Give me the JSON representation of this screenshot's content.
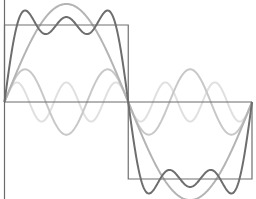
{
  "chart_data": {
    "type": "line",
    "title": "",
    "xlabel": "",
    "ylabel": "",
    "grid": false,
    "legend": null,
    "x_range": [
      0,
      6.2832
    ],
    "y_range": [
      -1.6,
      1.6
    ],
    "square_wave": {
      "high": 1,
      "low": -1,
      "jump_x": 3.1416
    },
    "series": [
      {
        "name": "fundamental (n=1)",
        "harmonic": 1,
        "amplitude": 1.2732,
        "color": "#b4b4b4",
        "width": 2
      },
      {
        "name": "3rd harmonic (n=3)",
        "harmonic": 3,
        "amplitude": 0.4244,
        "color": "#c8c8c8",
        "width": 2
      },
      {
        "name": "5th harmonic (n=5)",
        "harmonic": 5,
        "amplitude": 0.2546,
        "color": "#e0e0e0",
        "width": 2
      },
      {
        "name": "partial sum (n=1,3,5)",
        "harmonics": [
          1,
          3,
          5
        ],
        "color": "#6e6e6e",
        "width": 2
      },
      {
        "name": "square wave",
        "color": "#707070",
        "width": 1.2
      }
    ]
  },
  "layout": {
    "x0": 4.5,
    "x1": 252,
    "y_center": 102,
    "y_unit": 77,
    "axis_color": "#6a6a6a"
  }
}
